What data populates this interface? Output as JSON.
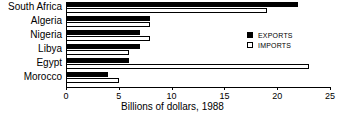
{
  "chart_data": {
    "type": "bar",
    "orientation": "horizontal",
    "title": "",
    "xlabel": "Billions of dollars, 1988",
    "ylabel": "",
    "xlim": [
      0,
      25
    ],
    "xticks": [
      0,
      5,
      10,
      15,
      20,
      25
    ],
    "xtick_labels": [
      "0",
      "5",
      "10",
      "15",
      "20",
      "25"
    ],
    "grid": false,
    "legend_position": "upper-right",
    "categories": [
      "South Africa",
      "Algeria",
      "Nigeria",
      "Libya",
      "Egypt",
      "Morocco"
    ],
    "series": [
      {
        "name": "EXPORTS",
        "color": "#000000",
        "values": [
          22,
          8,
          7,
          7,
          6,
          4
        ]
      },
      {
        "name": "IMPORTS",
        "color": "#ffffff",
        "values": [
          19,
          8,
          8,
          6,
          23,
          5
        ]
      }
    ]
  },
  "legend": {
    "items": [
      {
        "label": "EXPORTS",
        "swatch": "filled-square-icon"
      },
      {
        "label": "IMPORTS",
        "swatch": "outline-square-icon"
      }
    ]
  },
  "colors": {
    "exports": "#000000",
    "imports": "#ffffff",
    "axis": "#000000",
    "background": "#ffffff"
  }
}
